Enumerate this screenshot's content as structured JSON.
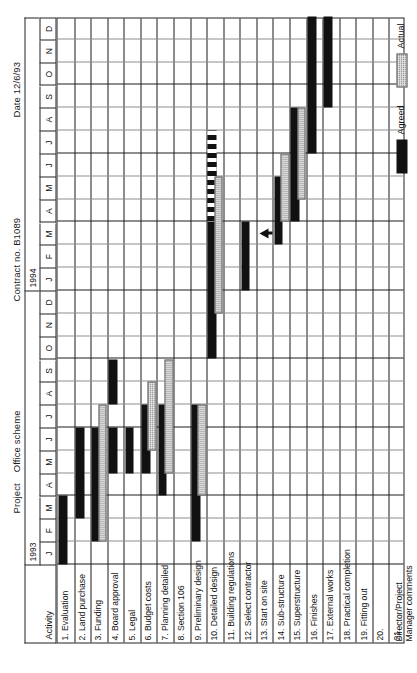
{
  "header": {
    "project_label": "Project",
    "project_name": "Office scheme",
    "contract_label": "Contract no. B1089",
    "date_label": "Date 12/6/93",
    "activity_column_header": "Activity"
  },
  "timeline": {
    "years": [
      {
        "label": "1993",
        "months": 12
      },
      {
        "label": "1994",
        "months": 12
      }
    ],
    "month_ticks": [
      "J",
      "F",
      "M",
      "A",
      "M",
      "J",
      "J",
      "A",
      "S",
      "O",
      "N",
      "D",
      "J",
      "F",
      "M",
      "A",
      "M",
      "J",
      "J",
      "A",
      "S",
      "O",
      "N",
      "D"
    ],
    "total_months": 24,
    "start": "1993-01",
    "end": "1994-12"
  },
  "legend": {
    "agreed_label": "Agreed",
    "actual_label": "Actual",
    "agreed_color": "#111111",
    "actual_color": "#9d9d9d"
  },
  "footer": {
    "comments_label_line1": "Director/Project",
    "comments_label_line2": "Manager comments"
  },
  "chart_data": {
    "type": "bar",
    "subtype": "gantt",
    "xlabel": "",
    "ylabel": "Activity",
    "xlim": [
      0,
      24
    ],
    "grid": true,
    "legend": [
      "Agreed",
      "Actual"
    ],
    "categories": [
      "1. Evaluation",
      "2. Land purchase",
      "3. Funding",
      "4. Board approval",
      "5. Legal",
      "6. Budget costs",
      "7. Planning detailed",
      "8. Section 106",
      "9. Preliminary design",
      "10. Detailed design",
      "11. Building regulations",
      "12. Select contractor",
      "13. Start on site",
      "14. Sub-structure",
      "15. Superstructure",
      "16. Finishes",
      "17. External works",
      "18. Practical completion",
      "19. Fitting out",
      "20.",
      "21."
    ],
    "tasks": [
      {
        "row": 1,
        "label": "1. Evaluation",
        "agreed": [
          1,
          3
        ],
        "actual": null
      },
      {
        "row": 2,
        "label": "2. Land purchase",
        "agreed": [
          3,
          6
        ],
        "actual": null
      },
      {
        "row": 3,
        "label": "3. Funding",
        "agreed": [
          2,
          6
        ],
        "actual": [
          2,
          7
        ]
      },
      {
        "row": 4,
        "label": "4. Board approval",
        "agreed": [
          5,
          6
        ],
        "actual": null,
        "extra_agreed": [
          8,
          9
        ]
      },
      {
        "row": 5,
        "label": "5. Legal",
        "agreed": [
          5,
          6
        ],
        "actual": null
      },
      {
        "row": 6,
        "label": "6. Budget costs",
        "agreed": [
          5,
          7
        ],
        "actual": [
          6,
          8
        ]
      },
      {
        "row": 7,
        "label": "7. Planning detailed",
        "agreed": [
          4,
          7
        ],
        "actual": [
          5,
          9
        ]
      },
      {
        "row": 8,
        "label": "8. Section 106",
        "agreed": null,
        "actual": null
      },
      {
        "row": 9,
        "label": "9. Preliminary design",
        "agreed": [
          2,
          7
        ],
        "actual": [
          4,
          7
        ]
      },
      {
        "row": 10,
        "label": "10. Detailed design",
        "agreed": [
          10,
          18
        ],
        "actual": [
          12,
          17
        ],
        "dashed": [
          16,
          19
        ]
      },
      {
        "row": 11,
        "label": "11. Building regulations",
        "agreed": null,
        "actual": null
      },
      {
        "row": 12,
        "label": "12. Select contractor",
        "agreed": [
          13,
          15
        ],
        "actual": null
      },
      {
        "row": 13,
        "label": "13. Start on site",
        "agreed": null,
        "actual": null,
        "milestone": 15
      },
      {
        "row": 14,
        "label": "14. Sub-structure",
        "agreed": [
          15,
          17
        ],
        "actual": [
          16,
          18
        ]
      },
      {
        "row": 15,
        "label": "15. Superstructure",
        "agreed": [
          16,
          20
        ],
        "actual": [
          17,
          20
        ]
      },
      {
        "row": 16,
        "label": "16. Finishes",
        "agreed": [
          19,
          24
        ],
        "actual": null
      },
      {
        "row": 17,
        "label": "17. External works",
        "agreed": [
          21,
          24
        ],
        "actual": null
      },
      {
        "row": 18,
        "label": "18. Practical completion",
        "agreed": null,
        "actual": null
      },
      {
        "row": 19,
        "label": "19. Fitting out",
        "agreed": null,
        "actual": null
      },
      {
        "row": 20,
        "label": "20.",
        "agreed": null,
        "actual": null
      },
      {
        "row": 21,
        "label": "21.",
        "agreed": null,
        "actual": null
      }
    ]
  }
}
